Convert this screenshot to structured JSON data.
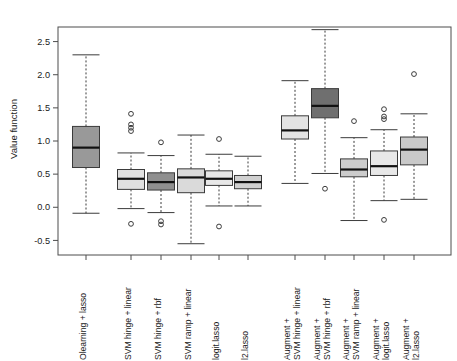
{
  "chart_data": {
    "type": "boxplot",
    "title": "",
    "xlabel": "",
    "ylabel": "Value function",
    "ylim": [
      -0.72,
      2.72
    ],
    "yticks": [
      -0.5,
      0.0,
      0.5,
      1.0,
      1.5,
      2.0,
      2.5
    ],
    "ytick_labels": [
      "-0.5",
      "0.0",
      "0.5",
      "1.0",
      "1.5",
      "2.0",
      "2.5"
    ],
    "grid": false,
    "legend": "none",
    "categories": [
      "Olearning + lasso",
      "SVM hinge + linear",
      "SVM hinge + rbf",
      "SVM ramp + linear",
      "logit.lasso",
      "l2.lasso",
      "Augment +\nSVM hinge + linear",
      "Augment +\nSVM hinge + rbf",
      "Augment +\nSVM ramp + linear",
      "Augment +\nlogit.lasso",
      "Augment +\nl2.lasso"
    ],
    "category_lines": [
      [
        "Olearning + lasso"
      ],
      [
        "SVM hinge + linear"
      ],
      [
        "SVM hinge + rbf"
      ],
      [
        "SVM ramp + linear"
      ],
      [
        "logit.lasso"
      ],
      [
        "l2.lasso"
      ],
      [
        "Augment +",
        "SVM hinge + linear"
      ],
      [
        "Augment +",
        "SVM hinge + rbf"
      ],
      [
        "Augment +",
        "SVM ramp + linear"
      ],
      [
        "Augment +",
        "logit.lasso"
      ],
      [
        "Augment +",
        "l2.lasso"
      ]
    ],
    "boxes": [
      {
        "name": "Olearning + lasso",
        "q1": 0.6,
        "median": 0.9,
        "q3": 1.22,
        "whisker_low": -0.09,
        "whisker_high": 2.3,
        "outliers": [],
        "fill": "#999999"
      },
      {
        "name": "SVM hinge + linear",
        "q1": 0.27,
        "median": 0.43,
        "q3": 0.57,
        "whisker_low": -0.02,
        "whisker_high": 0.82,
        "outliers": [
          1.41,
          1.25,
          1.2,
          1.15,
          -0.25
        ],
        "fill": "#e0e0e0"
      },
      {
        "name": "SVM hinge + rbf",
        "q1": 0.26,
        "median": 0.38,
        "q3": 0.52,
        "whisker_low": -0.08,
        "whisker_high": 0.78,
        "outliers": [
          0.98,
          -0.21,
          -0.26
        ],
        "fill": "#8f8f8f"
      },
      {
        "name": "SVM ramp + linear",
        "q1": 0.22,
        "median": 0.45,
        "q3": 0.58,
        "whisker_low": -0.55,
        "whisker_high": 1.09,
        "outliers": [],
        "fill": "#dadada"
      },
      {
        "name": "logit.lasso",
        "q1": 0.33,
        "median": 0.43,
        "q3": 0.55,
        "whisker_low": 0.02,
        "whisker_high": 0.8,
        "outliers": [
          1.03,
          -0.29
        ],
        "fill": "#e8e8e8"
      },
      {
        "name": "l2.lasso",
        "q1": 0.28,
        "median": 0.38,
        "q3": 0.48,
        "whisker_low": 0.02,
        "whisker_high": 0.77,
        "outliers": [],
        "fill": "#d0d0d0"
      },
      {
        "name": "Augment + SVM hinge + linear",
        "q1": 1.03,
        "median": 1.16,
        "q3": 1.38,
        "whisker_low": 0.36,
        "whisker_high": 1.91,
        "outliers": [],
        "fill": "#e3e3e3"
      },
      {
        "name": "Augment + SVM hinge + rbf",
        "q1": 1.35,
        "median": 1.53,
        "q3": 1.79,
        "whisker_low": 0.51,
        "whisker_high": 2.68,
        "outliers": [
          0.28
        ],
        "fill": "#6f6f6f"
      },
      {
        "name": "Augment + SVM ramp + linear",
        "q1": 0.46,
        "median": 0.57,
        "q3": 0.73,
        "whisker_low": -0.2,
        "whisker_high": 1.05,
        "outliers": [
          1.3
        ],
        "fill": "#cccccc"
      },
      {
        "name": "Augment + logit.lasso",
        "q1": 0.48,
        "median": 0.62,
        "q3": 0.85,
        "whisker_low": 0.1,
        "whisker_high": 1.17,
        "outliers": [
          1.48,
          1.37,
          1.33,
          -0.19
        ],
        "fill": "#e8e8e8"
      },
      {
        "name": "Augment + l2.lasso",
        "q1": 0.64,
        "median": 0.87,
        "q3": 1.06,
        "whisker_low": 0.12,
        "whisker_high": 1.41,
        "outliers": [
          2.01
        ],
        "fill": "#c9c9c9"
      }
    ]
  },
  "colors": {
    "axis": "#4d4d4d",
    "text": "#1a1a1a",
    "box_stroke": "#3b3b3b",
    "median": "#111111",
    "background": "#ffffff"
  }
}
